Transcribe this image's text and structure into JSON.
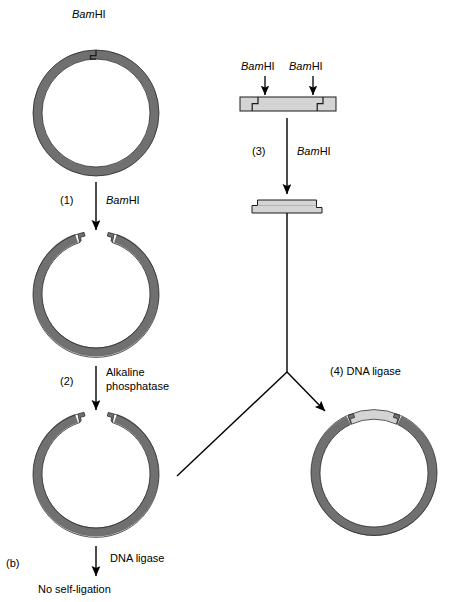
{
  "figure": {
    "panel_label": "(b)",
    "enzyme_name_italic": "Bam",
    "enzyme_name_roman": "HI"
  },
  "left_branch": {
    "top_enzyme_label_italic": "Bam",
    "top_enzyme_label_roman": "HI",
    "step1_number": "(1)",
    "step1_enzyme_italic": "Bam",
    "step1_enzyme_roman": "HI",
    "step2_number": "(2)",
    "step2_label_line1": "Alkaline",
    "step2_label_line2": "phosphatase",
    "step3_label": "DNA ligase",
    "outcome_label": "No self-ligation"
  },
  "right_branch": {
    "enzyme_label_left_italic": "Bam",
    "enzyme_label_left_roman": "HI",
    "enzyme_label_right_italic": "Bam",
    "enzyme_label_right_roman": "HI",
    "step3_number": "(3)",
    "step3_enzyme_italic": "Bam",
    "step3_enzyme_roman": "HI",
    "step4_label": "(4) DNA ligase"
  },
  "colors": {
    "plasmid_dark_gray": "#707070",
    "insert_light_gray": "#d4d4d4",
    "outline_black": "#1a1a1a",
    "background_white": "#ffffff"
  },
  "diagram": {
    "type": "molecular-cloning-schematic",
    "plasmid_circles": [
      {
        "name": "intact-plasmid",
        "cx": 96,
        "cy": 113,
        "outer_r": 63,
        "thickness": 9,
        "state": "circular-uncut"
      },
      {
        "name": "linearized-plasmid",
        "cx": 96,
        "cy": 297,
        "outer_r": 63,
        "thickness": 9,
        "state": "cut-open-sticky-ends"
      },
      {
        "name": "dephosphorylated-plasmid",
        "cx": 96,
        "cy": 477,
        "outer_r": 63,
        "thickness": 9,
        "state": "cut-open-dephosphorylated"
      },
      {
        "name": "recombinant-plasmid",
        "cx": 374,
        "cy": 477,
        "outer_r": 63,
        "thickness": 9,
        "state": "ligated-with-insert"
      }
    ],
    "linear_fragments": [
      {
        "name": "donor-dna-uncut",
        "x": 240,
        "y": 97,
        "width": 96,
        "height": 14,
        "cut_sites": 2
      },
      {
        "name": "excised-insert",
        "x": 252,
        "y": 200,
        "width": 70,
        "height": 13,
        "cut_sites": 0
      }
    ]
  }
}
